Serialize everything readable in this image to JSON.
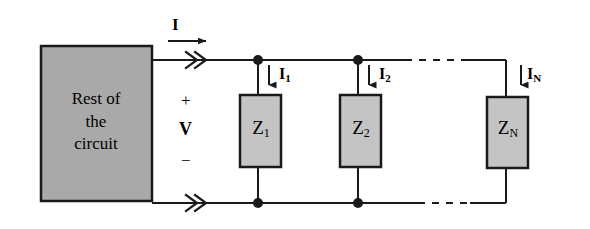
{
  "figure": {
    "background_color": "#ffffff",
    "wire_color": "#1a1a1a",
    "block_fill_color": "#b3b3b3",
    "block_stroke_color": "#1a1a1a"
  },
  "source_block": {
    "label": "Rest of\nthe\ncircuit",
    "line1": "Rest of",
    "line2": "the",
    "line3": "circuit",
    "fill": "#a9a9a9"
  },
  "terminal_labels": {
    "current": "I",
    "plus": "+",
    "voltage": "V",
    "minus": "−"
  },
  "branches": [
    {
      "id": "branch-1",
      "impedance_symbol": "Z",
      "impedance_subscript": "1",
      "current_symbol": "I",
      "current_subscript": "1"
    },
    {
      "id": "branch-2",
      "impedance_symbol": "Z",
      "impedance_subscript": "2",
      "current_symbol": "I",
      "current_subscript": "2"
    },
    {
      "id": "branch-N",
      "impedance_symbol": "Z",
      "impedance_subscript": "N",
      "current_symbol": "I",
      "current_subscript": "N"
    }
  ],
  "continuation": {
    "style": "dashed",
    "meaning": "additional parallel branches omitted"
  }
}
